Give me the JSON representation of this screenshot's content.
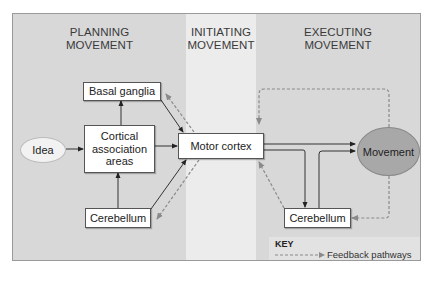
{
  "diagram": {
    "type": "flowchart",
    "stages": [
      {
        "id": "planning",
        "title_line1": "PLANNING",
        "title_line2": "MOVEMENT"
      },
      {
        "id": "initiating",
        "title_line1": "INITIATING",
        "title_line2": "MOVEMENT"
      },
      {
        "id": "executing",
        "title_line1": "EXECUTING",
        "title_line2": "MOVEMENT"
      }
    ],
    "nodes": {
      "idea": "Idea",
      "basal_ganglia": "Basal ganglia",
      "cortical_line1": "Cortical",
      "cortical_line2": "association",
      "cortical_line3": "areas",
      "cerebellum_planning": "Cerebellum",
      "motor_cortex": "Motor cortex",
      "movement": "Movement",
      "cerebellum_executing": "Cerebellum"
    },
    "key": {
      "title": "KEY",
      "feedback_label": "Feedback pathways"
    },
    "colors": {
      "zone_dark": "#d8d8d8",
      "zone_light": "#ececec",
      "movement_fill": "#a8a8a8",
      "idea_fill": "#f2f2f2",
      "solid_arrow": "#333333",
      "dashed_arrow": "#8a8a8a"
    },
    "edges": [
      {
        "from": "Idea",
        "to": "Cortical association areas",
        "style": "solid"
      },
      {
        "from": "Cortical association areas",
        "to": "Basal ganglia",
        "style": "solid"
      },
      {
        "from": "Cerebellum (planning)",
        "to": "Cortical association areas",
        "style": "solid"
      },
      {
        "from": "Cortical association areas",
        "to": "Motor cortex",
        "style": "solid"
      },
      {
        "from": "Basal ganglia",
        "to": "Motor cortex",
        "style": "solid"
      },
      {
        "from": "Motor cortex",
        "to": "Basal ganglia",
        "style": "dashed"
      },
      {
        "from": "Cerebellum (planning)",
        "to": "Motor cortex",
        "style": "solid"
      },
      {
        "from": "Motor cortex",
        "to": "Cerebellum (planning)",
        "style": "dashed"
      },
      {
        "from": "Motor cortex",
        "to": "Movement",
        "style": "solid"
      },
      {
        "from": "Motor cortex",
        "to": "Cerebellum (executing)",
        "style": "solid"
      },
      {
        "from": "Cerebellum (executing)",
        "to": "Movement",
        "style": "solid"
      },
      {
        "from": "Cerebellum (executing)",
        "to": "Motor cortex",
        "style": "dashed"
      },
      {
        "from": "Movement",
        "to": "Motor cortex",
        "style": "dashed"
      },
      {
        "from": "Movement",
        "to": "Cerebellum (executing)",
        "style": "dashed"
      }
    ]
  }
}
